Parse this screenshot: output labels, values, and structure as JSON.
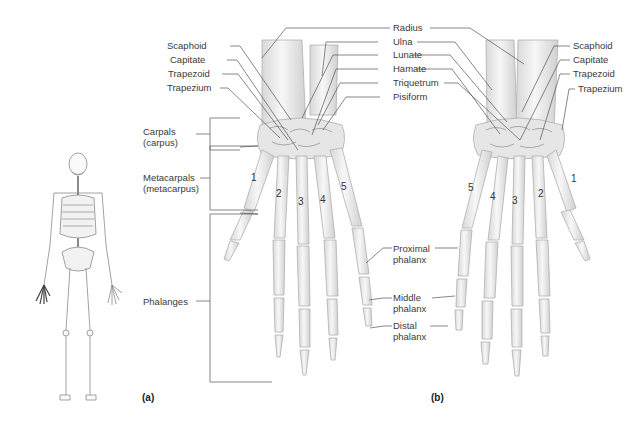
{
  "figure": {
    "panels": [
      {
        "id": "a",
        "label": "(a)",
        "view": "anterior view of right hand"
      },
      {
        "id": "b",
        "label": "(b)",
        "view": "posterior view of right hand"
      }
    ],
    "colors": {
      "bone_fill": "#ececec",
      "bone_stroke": "#b5b5b5",
      "leader_line": "#555555",
      "text": "#3a3a3a",
      "skeleton_highlight": "#555555"
    }
  },
  "panel_a": {
    "left_labels": [
      "Scaphoid",
      "Capitate",
      "Trapezoid",
      "Trapezium"
    ],
    "top_labels": [
      "Radius",
      "Ulna",
      "Lunate",
      "Hamate",
      "Triquetrum",
      "Pisiform"
    ],
    "groups": [
      {
        "line1": "Carpals",
        "line2": "(carpus)"
      },
      {
        "line1": "Metacarpals",
        "line2": "(metacarpus)"
      },
      {
        "line1": "Phalanges",
        "line2": ""
      }
    ],
    "metacarpal_numbers": [
      "1",
      "2",
      "3",
      "4",
      "5"
    ],
    "phalanx_labels": [
      {
        "line1": "Proximal",
        "line2": "phalanx"
      },
      {
        "line1": "Middle",
        "line2": "phalanx"
      },
      {
        "line1": "Distal",
        "line2": "phalanx"
      }
    ]
  },
  "panel_b": {
    "right_labels": [
      "Scaphoid",
      "Capitate",
      "Trapezoid",
      "Trapezium"
    ],
    "metacarpal_numbers": [
      "5",
      "4",
      "3",
      "2",
      "1"
    ]
  }
}
